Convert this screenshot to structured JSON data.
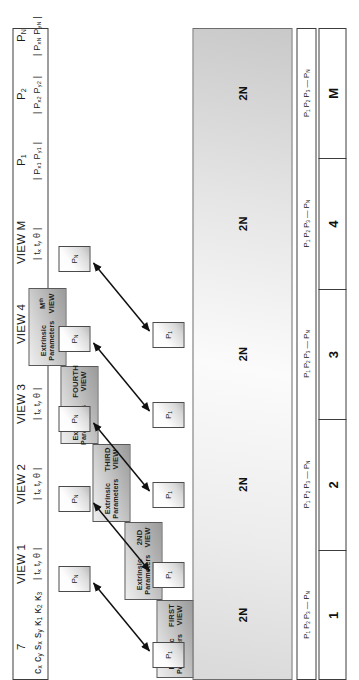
{
  "figure": {
    "type": "diagram"
  },
  "header": {
    "intrinsic_count": "7",
    "intrinsic_params": "c<sub>x</sub> c<sub>y</sub> s<sub>x</sub> s<sub>y</sub> κ<sub>1</sub> κ<sub>2</sub> κ<sub>3</sub>",
    "views": [
      {
        "name": "VIEW 1",
        "params": "| t<sub>x</sub> t<sub>y</sub> θ |"
      },
      {
        "name": "VIEW 2",
        "params": "| t<sub>x</sub> t<sub>y</sub> θ |"
      },
      {
        "name": "VIEW 3",
        "params": "| t<sub>x</sub> t<sub>y</sub> θ |"
      },
      {
        "name": "VIEW 4",
        "params": "| t<sub>x</sub> t<sub>y</sub> θ |"
      },
      {
        "name": "VIEW M",
        "params": "| t<sub>x</sub> t<sub>y</sub> θ |"
      }
    ],
    "points": [
      {
        "name": "P<sub>1</sub>",
        "coords": "| P<sub>x1</sub> P<sub>y1</sub> |"
      },
      {
        "name": "P<sub>2</sub>",
        "coords": "| P<sub>x2</sub> P<sub>y2</sub> |"
      },
      {
        "name": "P<sub>N</sub>",
        "coords": "| P<sub>xN</sub> P<sub>yN</sub> |"
      }
    ]
  },
  "extrinsic_blocks": [
    {
      "label": "Extrinsic\nParameters",
      "view": "FIRST\nVIEW"
    },
    {
      "label": "Extrinsic\nParameters",
      "view": "2ND\nVIEW"
    },
    {
      "label": "Extrinsic\nParameters",
      "view": "THIRD\nVIEW"
    },
    {
      "label": "Extrinsic\nParameters",
      "view": "FOURTH\nVIEW"
    },
    {
      "label": "Extrinsic\nParameters",
      "view": "M<sup>th</sup>\nVIEW"
    }
  ],
  "rows": [
    {
      "index": "1",
      "band": "2N",
      "points": "P<sub>1</sub> P<sub>2</sub> P<sub>3</sub> — P<sub>N</sub>"
    },
    {
      "index": "2",
      "band": "2N",
      "points": "P<sub>1</sub> P<sub>2</sub> P<sub>3</sub> — P<sub>N</sub>"
    },
    {
      "index": "3",
      "band": "2N",
      "points": "P<sub>1</sub> P<sub>2</sub> P<sub>3</sub> — P<sub>N</sub>"
    },
    {
      "index": "4",
      "band": "2N",
      "points": "P<sub>1</sub> P<sub>2</sub> P<sub>3</sub> — P<sub>N</sub>"
    },
    {
      "index": "M",
      "band": "2N",
      "points": "P<sub>1</sub> P<sub>2</sub> P<sub>3</sub> — P<sub>N</sub>"
    }
  ],
  "point_markers": {
    "first_label": "P<sub>1</sub>",
    "last_label": "P<sub>N</sub>",
    "count": 5
  },
  "colors": {
    "outline": "#3c3c3c",
    "block_border": "#58595b",
    "band_border": "#6d6d6d",
    "arrow": "#111111",
    "background": "#ffffff"
  }
}
